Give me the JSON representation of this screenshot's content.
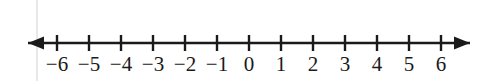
{
  "figure": {
    "type": "number-line",
    "background_color": "#ffffff",
    "stroke_color": "#1a1a1a",
    "page_rule_color": "#e9e9e9"
  },
  "chart_data": {
    "type": "number-line",
    "title": "",
    "xlabel": "",
    "ylabel": "",
    "orientation": "horizontal",
    "xlim": [
      -6.9,
      6.9
    ],
    "ticks": [
      -6,
      -5,
      -4,
      -3,
      -2,
      -1,
      0,
      1,
      2,
      3,
      4,
      5,
      6
    ],
    "tick_labels": [
      "−6",
      "−5",
      "−4",
      "−3",
      "−2",
      "−1",
      "0",
      "1",
      "2",
      "3",
      "4",
      "5",
      "6"
    ],
    "tick_count": 13,
    "tick_interval": 1,
    "arrows": [
      "left",
      "right"
    ],
    "grid": false,
    "plotted_points": [],
    "legend": []
  },
  "geometry": {
    "axis_y": 43,
    "axis_x_start": 28,
    "axis_x_end": 470,
    "first_tick_x": 57,
    "tick_spacing_px": 32,
    "tick_half_height": 8,
    "label_top": 54,
    "page_rule_x": 36
  }
}
